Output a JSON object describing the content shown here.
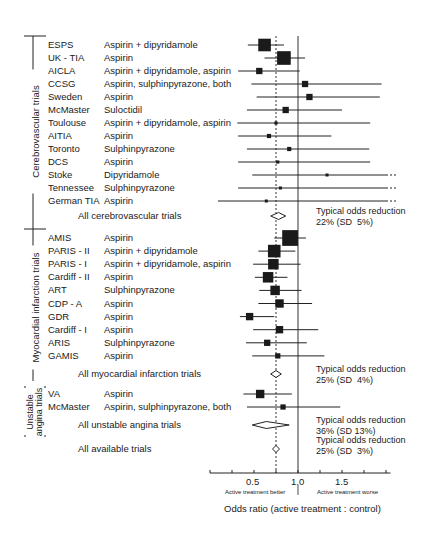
{
  "chart_data": {
    "type": "forest",
    "title": "",
    "xlabel": "Odds ratio (active treatment : control)",
    "x_ticks": [
      "0.5",
      "1.0",
      "1.5"
    ],
    "xlim": [
      0,
      2.0
    ],
    "reference_line": 1.0,
    "pooled_line": 0.75,
    "axis_annotations": {
      "left": "Active treatment better",
      "right": "Active treatment worse"
    },
    "groups": [
      {
        "name": "Cerebrovascular trials",
        "trials": [
          {
            "trial": "ESPS",
            "treatment": "Aspirin + dipyridamole",
            "or": 0.62,
            "lo": 0.43,
            "hi": 0.84,
            "weight": 12
          },
          {
            "trial": "UK - TIA",
            "treatment": "Aspirin",
            "or": 0.84,
            "lo": 0.62,
            "hi": 1.08,
            "weight": 13
          },
          {
            "trial": "AICLA",
            "treatment": "Aspirin + dipyridamole, aspirin",
            "or": 0.56,
            "lo": 0.32,
            "hi": 1.02,
            "weight": 6
          },
          {
            "trial": "CCSG",
            "treatment": "Aspirin, sulphinpyrazone, both",
            "or": 1.08,
            "lo": 0.47,
            "hi": 1.95,
            "weight": 6
          },
          {
            "trial": "Sweden",
            "treatment": "Aspirin",
            "or": 1.13,
            "lo": 0.53,
            "hi": 1.93,
            "weight": 6
          },
          {
            "trial": "McMaster",
            "treatment": "Suloctidil",
            "or": 0.86,
            "lo": 0.42,
            "hi": 1.5,
            "weight": 6
          },
          {
            "trial": "Toulouse",
            "treatment": "Aspirin + dipyridamole, aspirin",
            "or": 0.75,
            "lo": 0.31,
            "hi": 1.82,
            "weight": 3
          },
          {
            "trial": "AITIA",
            "treatment": "Aspirin",
            "or": 0.67,
            "lo": 0.32,
            "hi": 1.38,
            "weight": 4
          },
          {
            "trial": "Toronto",
            "treatment": "Sulphinpyrazone",
            "or": 0.9,
            "lo": 0.42,
            "hi": 1.81,
            "weight": 4
          },
          {
            "trial": "DCS",
            "treatment": "Aspirin",
            "or": 0.77,
            "lo": 0.32,
            "hi": 1.82,
            "weight": 3
          },
          {
            "trial": "Stoke",
            "treatment": "Dipyridamole",
            "or": 1.33,
            "lo": 0.48,
            "hi": 2.0,
            "weight": 2,
            "open_right": true
          },
          {
            "trial": "Tennessee",
            "treatment": "Sulphinpyrazone",
            "or": 0.8,
            "lo": 0.32,
            "hi": 2.0,
            "weight": 2,
            "open_right": true
          },
          {
            "trial": "German TIA",
            "treatment": "Aspirin",
            "or": 0.64,
            "lo": 0.09,
            "hi": 2.0,
            "weight": 1,
            "open_right": true
          }
        ],
        "summary": {
          "label": "All cerebrovascular trials",
          "or": 0.78,
          "lo": 0.69,
          "hi": 0.86,
          "note": "Typical odds reduction\n22% (SD  5%)"
        }
      },
      {
        "name": "Myocardial infarction trials",
        "trials": [
          {
            "trial": "AMIS",
            "treatment": "Aspirin",
            "or": 0.91,
            "lo": 0.73,
            "hi": 1.09,
            "weight": 15
          },
          {
            "trial": "PARIS - II",
            "treatment": "Aspirin + dipyridamole",
            "or": 0.73,
            "lo": 0.55,
            "hi": 0.97,
            "weight": 12
          },
          {
            "trial": "PARIS - I",
            "treatment": "Aspirin + dipyridamole, aspirin",
            "or": 0.72,
            "lo": 0.49,
            "hi": 1.03,
            "weight": 10
          },
          {
            "trial": "Cardiff - II",
            "treatment": "Aspirin",
            "or": 0.66,
            "lo": 0.51,
            "hi": 0.88,
            "weight": 10
          },
          {
            "trial": "ART",
            "treatment": "Sulphinpyrazone",
            "or": 0.74,
            "lo": 0.56,
            "hi": 1.04,
            "weight": 9
          },
          {
            "trial": "CDP - A",
            "treatment": "Aspirin",
            "or": 0.79,
            "lo": 0.55,
            "hi": 1.16,
            "weight": 8
          },
          {
            "trial": "GDR",
            "treatment": "Aspirin",
            "or": 0.45,
            "lo": 0.34,
            "hi": 0.73,
            "weight": 7
          },
          {
            "trial": "Cardiff - I",
            "treatment": "Aspirin",
            "or": 0.79,
            "lo": 0.49,
            "hi": 1.23,
            "weight": 7
          },
          {
            "trial": "ARIS",
            "treatment": "Sulphinpyrazone",
            "or": 0.65,
            "lo": 0.41,
            "hi": 1.1,
            "weight": 6
          },
          {
            "trial": "GAMIS",
            "treatment": "Aspirin",
            "or": 0.77,
            "lo": 0.48,
            "hi": 1.3,
            "weight": 5
          }
        ],
        "summary": {
          "label": "All myocardial infarction trials",
          "or": 0.75,
          "lo": 0.69,
          "hi": 0.81,
          "note": "Typical odds reduction\n25% (SD  4%)"
        }
      },
      {
        "name": "Unstable angina trials",
        "trials": [
          {
            "trial": "VA",
            "treatment": "Aspirin",
            "or": 0.57,
            "lo": 0.38,
            "hi": 0.93,
            "weight": 8
          },
          {
            "trial": "McMaster",
            "treatment": "Aspirin, sulphinpyrazone, both",
            "or": 0.83,
            "lo": 0.42,
            "hi": 1.48,
            "weight": 5
          }
        ],
        "summary": {
          "label": "All unstable angina trials",
          "or": 0.64,
          "lo": 0.48,
          "hi": 0.9,
          "note": "Typical odds reduction\n36% (SD 13%)"
        }
      }
    ],
    "overall": {
      "label": "All available trials",
      "or": 0.75,
      "lo": 0.71,
      "hi": 0.79,
      "note": "Typical odds reduction\n25% (SD  3%)"
    }
  }
}
